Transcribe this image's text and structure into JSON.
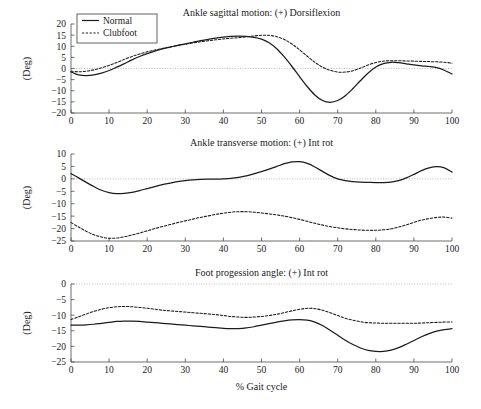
{
  "figure": {
    "xlabel": "% Gait cycle",
    "ylabel": "(Deg)",
    "legend": {
      "entries": [
        {
          "label": "Normal",
          "style": "solid"
        },
        {
          "label": "Clubfoot",
          "style": "dashed"
        }
      ]
    }
  },
  "chart_data": [
    {
      "type": "line",
      "title": "Ankle sagittal motion: (+) Dorsiflexion",
      "xlabel": "",
      "ylabel": "(Deg)",
      "xlim": [
        0,
        100
      ],
      "ylim": [
        -20,
        20
      ],
      "xticks": [
        0,
        10,
        20,
        30,
        40,
        50,
        60,
        70,
        80,
        90,
        100
      ],
      "yticks": [
        20,
        15,
        10,
        5,
        0,
        -5,
        -10,
        -15,
        -20
      ],
      "grid": false,
      "zero_reference": 0,
      "legend_position": "top-left",
      "x": [
        0,
        2,
        4,
        6,
        8,
        10,
        12,
        14,
        16,
        18,
        20,
        22,
        24,
        26,
        28,
        30,
        32,
        34,
        36,
        38,
        40,
        42,
        44,
        46,
        48,
        50,
        52,
        54,
        56,
        58,
        60,
        62,
        64,
        66,
        68,
        70,
        72,
        74,
        76,
        78,
        80,
        82,
        84,
        86,
        88,
        90,
        92,
        94,
        96,
        98,
        100
      ],
      "series": [
        {
          "name": "Normal",
          "values": [
            -1.5,
            -2.9,
            -3.2,
            -2.9,
            -2.1,
            -0.9,
            0.6,
            2.2,
            3.9,
            5.4,
            6.7,
            7.8,
            8.8,
            9.6,
            10.4,
            11.1,
            11.8,
            12.5,
            13.1,
            13.7,
            14.1,
            14.4,
            14.5,
            14.4,
            14.0,
            13.2,
            11.6,
            8.9,
            5.2,
            0.9,
            -3.7,
            -8.1,
            -11.9,
            -14.4,
            -15.2,
            -14.4,
            -12.2,
            -9.0,
            -5.4,
            -2.0,
            0.7,
            2.2,
            2.8,
            2.6,
            2.1,
            1.6,
            1.2,
            0.9,
            0.4,
            -0.8,
            -2.5
          ]
        },
        {
          "name": "Clubfoot",
          "values": [
            -1.2,
            -1.5,
            -1.2,
            -0.6,
            0.3,
            1.4,
            2.7,
            4.1,
            5.4,
            6.5,
            7.5,
            8.3,
            9.0,
            9.7,
            10.3,
            10.9,
            11.5,
            12.0,
            12.5,
            12.9,
            13.3,
            13.6,
            13.9,
            14.2,
            14.6,
            14.9,
            14.9,
            14.3,
            13.0,
            11.0,
            8.4,
            5.5,
            2.8,
            0.6,
            -0.8,
            -1.6,
            -1.6,
            -1.0,
            0.2,
            1.6,
            2.7,
            3.3,
            3.5,
            3.5,
            3.4,
            3.3,
            3.2,
            3.1,
            3.0,
            2.8,
            2.4
          ]
        }
      ]
    },
    {
      "type": "line",
      "title": "Ankle transverse motion: (+) Int rot",
      "xlabel": "",
      "ylabel": "(Deg)",
      "xlim": [
        0,
        100
      ],
      "ylim": [
        -25,
        10
      ],
      "xticks": [
        0,
        10,
        20,
        30,
        40,
        50,
        60,
        70,
        80,
        90,
        100
      ],
      "yticks": [
        10,
        5,
        0,
        -5,
        -10,
        -15,
        -20,
        -25
      ],
      "grid": false,
      "zero_reference": 0,
      "legend_position": "none",
      "x": [
        0,
        2,
        4,
        6,
        8,
        10,
        12,
        14,
        16,
        18,
        20,
        22,
        24,
        26,
        28,
        30,
        32,
        34,
        36,
        38,
        40,
        42,
        44,
        46,
        48,
        50,
        52,
        54,
        56,
        58,
        60,
        62,
        64,
        66,
        68,
        70,
        72,
        74,
        76,
        78,
        80,
        82,
        84,
        86,
        88,
        90,
        92,
        94,
        96,
        98,
        100
      ],
      "series": [
        {
          "name": "Normal",
          "values": [
            2.1,
            0.4,
            -1.4,
            -3.1,
            -4.6,
            -5.5,
            -5.9,
            -5.8,
            -5.4,
            -4.7,
            -3.9,
            -3.1,
            -2.3,
            -1.7,
            -1.1,
            -0.7,
            -0.4,
            -0.2,
            -0.1,
            -0.1,
            0.0,
            0.2,
            0.6,
            1.2,
            2.0,
            2.9,
            3.9,
            5.0,
            6.1,
            6.8,
            6.9,
            6.2,
            4.8,
            3.0,
            1.3,
            0.0,
            -0.7,
            -1.1,
            -1.3,
            -1.4,
            -1.5,
            -1.5,
            -1.3,
            -0.7,
            0.4,
            1.8,
            3.3,
            4.4,
            4.9,
            4.4,
            2.7
          ]
        },
        {
          "name": "Clubfoot",
          "values": [
            -17.6,
            -19.4,
            -21.1,
            -22.5,
            -23.4,
            -23.9,
            -23.8,
            -23.3,
            -22.6,
            -21.8,
            -20.9,
            -20.0,
            -19.2,
            -18.4,
            -17.6,
            -16.9,
            -16.2,
            -15.5,
            -14.9,
            -14.3,
            -13.8,
            -13.4,
            -13.2,
            -13.2,
            -13.4,
            -13.7,
            -14.1,
            -14.5,
            -15.0,
            -15.6,
            -16.3,
            -17.1,
            -17.9,
            -18.6,
            -19.2,
            -19.7,
            -20.1,
            -20.4,
            -20.6,
            -20.7,
            -20.7,
            -20.5,
            -20.1,
            -19.4,
            -18.5,
            -17.5,
            -16.6,
            -16.0,
            -15.5,
            -15.4,
            -15.8
          ]
        }
      ]
    },
    {
      "type": "line",
      "title": "Foot progession angle: (+) Int rot",
      "xlabel": "% Gait cycle",
      "ylabel": "(Deg)",
      "xlim": [
        0,
        100
      ],
      "ylim": [
        -25,
        0
      ],
      "xticks": [
        0,
        10,
        20,
        30,
        40,
        50,
        60,
        70,
        80,
        90,
        100
      ],
      "yticks": [
        0,
        -5,
        -10,
        -15,
        -20,
        -25
      ],
      "grid": false,
      "zero_reference": 0,
      "legend_position": "none",
      "x": [
        0,
        2,
        4,
        6,
        8,
        10,
        12,
        14,
        16,
        18,
        20,
        22,
        24,
        26,
        28,
        30,
        32,
        34,
        36,
        38,
        40,
        42,
        44,
        46,
        48,
        50,
        52,
        54,
        56,
        58,
        60,
        62,
        64,
        66,
        68,
        70,
        72,
        74,
        76,
        78,
        80,
        82,
        84,
        86,
        88,
        90,
        92,
        94,
        96,
        98,
        100
      ],
      "series": [
        {
          "name": "Normal",
          "values": [
            -13.2,
            -13.2,
            -13.1,
            -12.9,
            -12.6,
            -12.3,
            -12.0,
            -11.9,
            -11.9,
            -12.0,
            -12.2,
            -12.4,
            -12.6,
            -12.8,
            -13.0,
            -13.2,
            -13.4,
            -13.6,
            -13.8,
            -14.0,
            -14.2,
            -14.3,
            -14.3,
            -14.1,
            -13.7,
            -13.2,
            -12.7,
            -12.2,
            -11.8,
            -11.5,
            -11.4,
            -11.6,
            -12.2,
            -13.3,
            -14.8,
            -16.4,
            -18.0,
            -19.4,
            -20.5,
            -21.3,
            -21.6,
            -21.6,
            -21.2,
            -20.4,
            -19.3,
            -18.1,
            -16.9,
            -15.9,
            -15.1,
            -14.6,
            -14.3
          ]
        },
        {
          "name": "Clubfoot",
          "values": [
            -11.4,
            -10.5,
            -9.6,
            -8.8,
            -8.1,
            -7.6,
            -7.3,
            -7.2,
            -7.3,
            -7.5,
            -7.8,
            -8.1,
            -8.4,
            -8.6,
            -8.8,
            -9.0,
            -9.2,
            -9.4,
            -9.6,
            -9.8,
            -10.1,
            -10.4,
            -10.6,
            -10.7,
            -10.6,
            -10.4,
            -10.1,
            -9.7,
            -9.2,
            -8.6,
            -8.1,
            -7.8,
            -7.9,
            -8.4,
            -9.2,
            -10.1,
            -11.0,
            -11.6,
            -12.1,
            -12.4,
            -12.5,
            -12.6,
            -12.6,
            -12.6,
            -12.6,
            -12.6,
            -12.5,
            -12.4,
            -12.3,
            -12.2,
            -12.2
          ]
        }
      ]
    }
  ]
}
